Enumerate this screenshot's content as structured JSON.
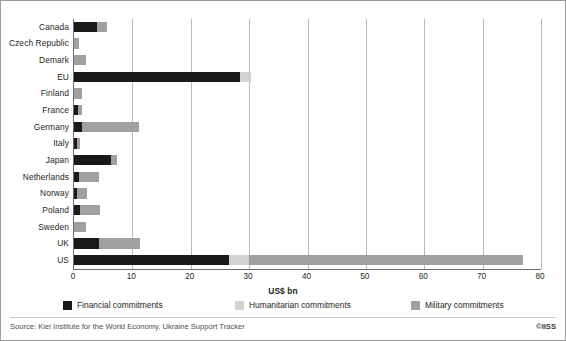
{
  "chart_data": {
    "type": "bar",
    "orientation": "horizontal",
    "stacked": true,
    "title": "",
    "xlabel": "US$ bn",
    "ylabel": "",
    "xlim": [
      0,
      80
    ],
    "xticks": [
      0,
      10,
      20,
      30,
      40,
      50,
      60,
      70,
      80
    ],
    "grid": "vertical",
    "legend_position": "bottom",
    "categories": [
      "Canada",
      "Czech Republic",
      "Demark",
      "EU",
      "Finland",
      "France",
      "Germany",
      "Italy",
      "Japan",
      "Netherlands",
      "Norway",
      "Poland",
      "Sweden",
      "UK",
      "US"
    ],
    "series": [
      {
        "name": "Financial commitments",
        "color": "#1a1a1a",
        "values": [
          3.9,
          0.0,
          0.0,
          28.4,
          0.0,
          0.6,
          1.3,
          0.5,
          6.4,
          0.8,
          0.5,
          1.1,
          0.0,
          4.2,
          26.5
        ]
      },
      {
        "name": "Humanitarian commitments",
        "color": "#d2d2d2",
        "values": [
          0.0,
          0.0,
          0.0,
          1.9,
          0.0,
          0.0,
          0.0,
          0.0,
          0.0,
          0.0,
          0.0,
          0.0,
          0.0,
          0.0,
          3.5
        ]
      },
      {
        "name": "Military commitments",
        "color": "#a0a0a0",
        "values": [
          1.7,
          0.8,
          2.1,
          0.0,
          1.4,
          0.7,
          9.9,
          0.5,
          0.9,
          3.5,
          1.8,
          3.4,
          2.0,
          7.1,
          47.0
        ]
      }
    ]
  },
  "axis": {
    "xlabel": "US$ bn",
    "tick_labels": [
      "0",
      "10",
      "20",
      "30",
      "40",
      "50",
      "60",
      "70",
      "80"
    ]
  },
  "legend": {
    "items": [
      {
        "label": "Financial commitments",
        "color": "#1a1a1a",
        "swatch_name": "legend-swatch-financial"
      },
      {
        "label": "Humanitarian commitments",
        "color": "#d2d2d2",
        "swatch_name": "legend-swatch-humanitarian"
      },
      {
        "label": "Military commitments",
        "color": "#a0a0a0",
        "swatch_name": "legend-swatch-military"
      }
    ]
  },
  "footer": {
    "source": "Source: Kiel Institute for the World Economy, Ukraine Support Tracker",
    "credit": "©IISS"
  }
}
